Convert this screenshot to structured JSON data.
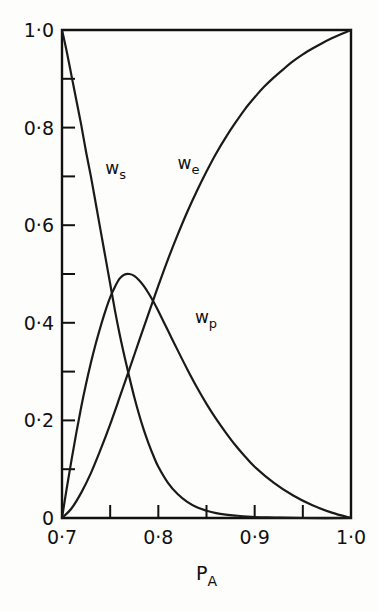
{
  "figure": {
    "background_color": "#fdfdfc",
    "line_color": "#1a1a1a",
    "frame_color": "#111111"
  },
  "chart_data": {
    "type": "line",
    "title": "",
    "subtitle": "",
    "xlabel": "P",
    "xlabel_subscript": "A",
    "ylabel": "",
    "xlim": [
      0.7,
      1.0
    ],
    "ylim": [
      0.0,
      1.0
    ],
    "grid": false,
    "legend_position": "inline-curve-labels",
    "x_ticks_major": [
      "0·7",
      "0·8",
      "0·9",
      "1·0"
    ],
    "x_tick_values_major": [
      0.7,
      0.8,
      0.9,
      1.0
    ],
    "x_tick_values_minor": [
      0.75,
      0.85,
      0.95
    ],
    "y_ticks_major": [
      "0",
      "0·2",
      "0·4",
      "0·6",
      "0·8",
      "1·0"
    ],
    "y_tick_values_major": [
      0.0,
      0.2,
      0.4,
      0.6,
      0.8,
      1.0
    ],
    "y_tick_values_minor": [
      0.1,
      0.3,
      0.5,
      0.7,
      0.9
    ],
    "series": [
      {
        "name": "w_s",
        "label": "w",
        "label_subscript": "s",
        "label_x": 0.745,
        "label_y": 0.705,
        "x": [
          0.7,
          0.705,
          0.71,
          0.715,
          0.72,
          0.725,
          0.73,
          0.735,
          0.74,
          0.745,
          0.75,
          0.755,
          0.76,
          0.765,
          0.77,
          0.775,
          0.78,
          0.785,
          0.79,
          0.795,
          0.8,
          0.81,
          0.82,
          0.83,
          0.84,
          0.85,
          0.86,
          0.87,
          0.88,
          0.9,
          0.92,
          0.95,
          1.0
        ],
        "y": [
          1.0,
          0.955,
          0.905,
          0.855,
          0.805,
          0.75,
          0.7,
          0.645,
          0.59,
          0.535,
          0.48,
          0.425,
          0.375,
          0.33,
          0.288,
          0.248,
          0.212,
          0.18,
          0.152,
          0.127,
          0.105,
          0.072,
          0.049,
          0.033,
          0.022,
          0.015,
          0.01,
          0.007,
          0.005,
          0.002,
          0.001,
          0.0,
          0.0
        ]
      },
      {
        "name": "w_p",
        "label": "w",
        "label_subscript": "p",
        "label_x": 0.838,
        "label_y": 0.4,
        "x": [
          0.7,
          0.705,
          0.71,
          0.715,
          0.72,
          0.725,
          0.73,
          0.735,
          0.74,
          0.745,
          0.75,
          0.755,
          0.76,
          0.765,
          0.77,
          0.775,
          0.78,
          0.785,
          0.79,
          0.795,
          0.8,
          0.81,
          0.82,
          0.83,
          0.84,
          0.85,
          0.86,
          0.87,
          0.88,
          0.89,
          0.9,
          0.92,
          0.94,
          0.96,
          0.98,
          1.0
        ],
        "y": [
          0.0,
          0.062,
          0.12,
          0.176,
          0.228,
          0.275,
          0.318,
          0.357,
          0.392,
          0.424,
          0.452,
          0.474,
          0.491,
          0.499,
          0.5,
          0.496,
          0.487,
          0.475,
          0.46,
          0.443,
          0.424,
          0.384,
          0.344,
          0.305,
          0.268,
          0.234,
          0.203,
          0.175,
          0.149,
          0.126,
          0.105,
          0.072,
          0.046,
          0.026,
          0.011,
          0.0
        ]
      },
      {
        "name": "w_e",
        "label": "w",
        "label_subscript": "e",
        "label_x": 0.82,
        "label_y": 0.715,
        "x": [
          0.7,
          0.71,
          0.72,
          0.73,
          0.74,
          0.75,
          0.76,
          0.77,
          0.78,
          0.79,
          0.8,
          0.81,
          0.82,
          0.83,
          0.84,
          0.85,
          0.86,
          0.87,
          0.88,
          0.89,
          0.9,
          0.91,
          0.92,
          0.93,
          0.94,
          0.95,
          0.96,
          0.97,
          0.98,
          0.99,
          1.0
        ],
        "y": [
          0.0,
          0.02,
          0.052,
          0.092,
          0.14,
          0.192,
          0.248,
          0.305,
          0.363,
          0.42,
          0.476,
          0.53,
          0.58,
          0.627,
          0.67,
          0.71,
          0.747,
          0.78,
          0.81,
          0.838,
          0.862,
          0.884,
          0.903,
          0.92,
          0.936,
          0.95,
          0.962,
          0.973,
          0.983,
          0.992,
          1.0
        ]
      }
    ]
  }
}
